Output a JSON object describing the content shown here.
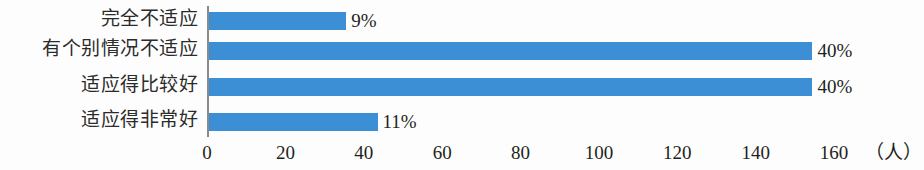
{
  "chart_data": {
    "type": "bar",
    "orientation": "horizontal",
    "title": "",
    "xlabel": "（人）",
    "ylabel": "",
    "categories": [
      "完全不适应",
      "有个别情况不适应",
      "适应得比较好",
      "适应得非常好"
    ],
    "values": [
      35,
      154,
      154,
      43
    ],
    "data_labels": [
      "9%",
      "40%",
      "40%",
      "11%"
    ],
    "xticks": [
      "0",
      "20",
      "40",
      "60",
      "80",
      "100",
      "120",
      "140",
      "160"
    ],
    "xtick_values": [
      0,
      20,
      40,
      60,
      80,
      100,
      120,
      140,
      160
    ],
    "xlim": [
      0,
      168
    ],
    "grid": false,
    "legend": null,
    "bar_color": "#3c8fd4",
    "axis_color": "#8a8a8a",
    "text_color": "#231f20"
  },
  "axis": {
    "unit_label": "（人）"
  }
}
